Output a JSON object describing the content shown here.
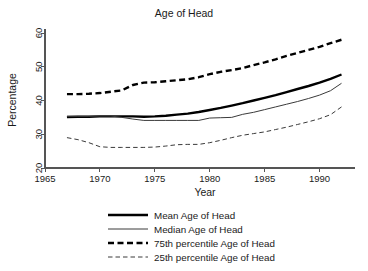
{
  "chart_data": {
    "type": "line",
    "title": "Age of Head",
    "xlabel": "Year",
    "ylabel": "Percentage",
    "xlim": [
      1965,
      1992.5
    ],
    "ylim": [
      20,
      62
    ],
    "xticks": [
      1965,
      1970,
      1975,
      1980,
      1985,
      1990
    ],
    "yticks": [
      20,
      30,
      40,
      50,
      60
    ],
    "grid": false,
    "legend_position": "below",
    "x": [
      1967,
      1968,
      1969,
      1970,
      1971,
      1972,
      1973,
      1974,
      1975,
      1976,
      1977,
      1978,
      1979,
      1980,
      1981,
      1982,
      1983,
      1984,
      1985,
      1986,
      1987,
      1988,
      1989,
      1990,
      1991,
      1992
    ],
    "series": [
      {
        "name": "Mean Age of Head",
        "style": "thick-solid",
        "values": [
          35.1,
          35.2,
          35.2,
          35.3,
          35.3,
          35.3,
          35.3,
          35.2,
          35.3,
          35.5,
          35.8,
          36.1,
          36.6,
          37.2,
          37.8,
          38.5,
          39.2,
          40.0,
          40.8,
          41.6,
          42.5,
          43.4,
          44.3,
          45.3,
          46.4,
          47.7
        ]
      },
      {
        "name": "Median Age of Head",
        "style": "thin-solid",
        "values": [
          35.3,
          35.3,
          35.3,
          35.4,
          35.4,
          35.0,
          34.5,
          34.1,
          34.1,
          34.1,
          34.1,
          34.1,
          34.1,
          34.8,
          34.9,
          35.0,
          35.9,
          36.5,
          37.3,
          38.1,
          38.9,
          39.7,
          40.6,
          41.6,
          42.9,
          45.1
        ]
      },
      {
        "name": "75th percentile Age of Head",
        "style": "thick-dashed",
        "values": [
          41.9,
          41.9,
          42.0,
          42.2,
          42.6,
          43.0,
          44.6,
          45.3,
          45.4,
          45.7,
          46.0,
          46.3,
          46.9,
          47.8,
          48.5,
          49.0,
          49.6,
          50.5,
          51.3,
          52.2,
          53.2,
          54.1,
          55.0,
          55.9,
          57.0,
          58.0
        ]
      },
      {
        "name": "25th percentile Age of Head",
        "style": "thin-dashed",
        "values": [
          29.0,
          28.4,
          27.5,
          26.3,
          26.1,
          26.1,
          26.1,
          26.1,
          26.2,
          26.5,
          26.9,
          27.0,
          27.0,
          27.5,
          28.2,
          29.0,
          29.7,
          30.2,
          30.7,
          31.4,
          32.1,
          32.9,
          33.7,
          34.6,
          35.8,
          38.1
        ]
      }
    ]
  },
  "legend": {
    "items": [
      {
        "label": "Mean Age of Head"
      },
      {
        "label": "Median Age of Head"
      },
      {
        "label": "75th percentile Age of Head"
      },
      {
        "label": "25th percentile Age of Head"
      }
    ]
  },
  "colors": {
    "line": "#000000",
    "thin_line": "#3a3a3a",
    "axis": "#555555",
    "background": "#ffffff"
  }
}
